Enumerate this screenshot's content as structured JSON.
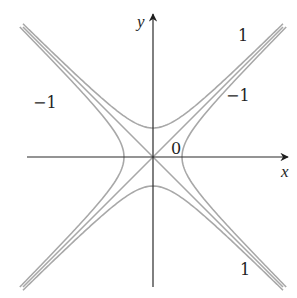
{
  "figure": {
    "axes": {
      "x_label": "x",
      "y_label": "y",
      "axis_color": "#2b2b2b",
      "curve_color": "#a8a8a8"
    },
    "labels": [
      {
        "text": "1",
        "position": "upper-right"
      },
      {
        "text": "−1",
        "position": "right"
      },
      {
        "text": "−1",
        "position": "left"
      },
      {
        "text": "0",
        "position": "near-origin"
      },
      {
        "text": "1",
        "position": "lower-right"
      }
    ],
    "level_curves": [
      {
        "level": 1,
        "shape": "hyperbola opening up and down"
      },
      {
        "level": -1,
        "shape": "hyperbola opening left and right"
      },
      {
        "level": 0,
        "shape": "pair of crossing asymptote lines y = ±x"
      }
    ]
  }
}
